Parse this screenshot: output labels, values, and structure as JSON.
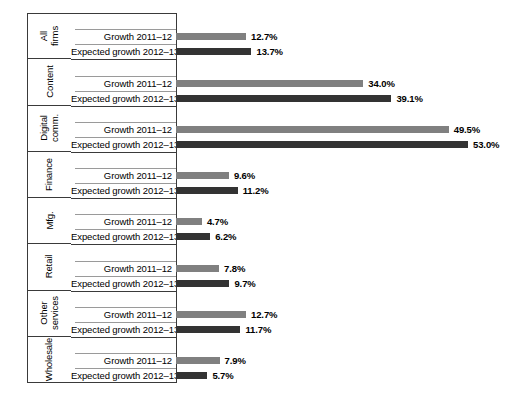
{
  "chart": {
    "type": "bar",
    "orientation": "horizontal",
    "series_labels": {
      "s1": "Growth 2011–12",
      "s2": "Expected growth 2012–13"
    },
    "colors": {
      "series_1": "#808080",
      "series_2": "#333333",
      "frame": "#3a3a3a",
      "row_line": "#9a9a9a",
      "background": "#ffffff"
    }
  },
  "chart_data": {
    "type": "bar",
    "title": "",
    "subtitle": "",
    "xlabel": "",
    "ylabel": "",
    "orientation": "horizontal",
    "grid": false,
    "legend": false,
    "value_format": "percent_1dp",
    "xlim": [
      0,
      53
    ],
    "categories": [
      "All firms",
      "Content",
      "Digital comm.",
      "Finance",
      "Mfg.",
      "Retail",
      "Other services",
      "Wholesale"
    ],
    "series": [
      {
        "name": "Growth 2011–12",
        "color": "#808080",
        "values": [
          12.7,
          34.0,
          49.5,
          9.6,
          4.7,
          7.8,
          12.7,
          7.9
        ]
      },
      {
        "name": "Expected growth 2012–13",
        "color": "#333333",
        "values": [
          13.7,
          39.1,
          53.0,
          11.2,
          6.2,
          9.7,
          11.7,
          5.7
        ]
      }
    ]
  },
  "groups": [
    {
      "category_line1": "All",
      "category_line2": "firms",
      "rows": [
        {
          "label": "Growth 2011–12",
          "value": 12.7,
          "value_text": "12.7%",
          "series": "s1"
        },
        {
          "label": "Expected growth 2012–13",
          "value": 13.7,
          "value_text": "13.7%",
          "series": "s2"
        }
      ]
    },
    {
      "category_line1": "Content",
      "category_line2": "",
      "rows": [
        {
          "label": "Growth 2011–12",
          "value": 34.0,
          "value_text": "34.0%",
          "series": "s1"
        },
        {
          "label": "Expected growth 2012–13",
          "value": 39.1,
          "value_text": "39.1%",
          "series": "s2"
        }
      ]
    },
    {
      "category_line1": "Digital",
      "category_line2": "comm.",
      "rows": [
        {
          "label": "Growth 2011–12",
          "value": 49.5,
          "value_text": "49.5%",
          "series": "s1"
        },
        {
          "label": "Expected growth 2012–13",
          "value": 53.0,
          "value_text": "53.0%",
          "series": "s2"
        }
      ]
    },
    {
      "category_line1": "Finance",
      "category_line2": "",
      "rows": [
        {
          "label": "Growth 2011–12",
          "value": 9.6,
          "value_text": "9.6%",
          "series": "s1"
        },
        {
          "label": "Expected growth 2012–13",
          "value": 11.2,
          "value_text": "11.2%",
          "series": "s2"
        }
      ]
    },
    {
      "category_line1": "Mfg.",
      "category_line2": "",
      "rows": [
        {
          "label": "Growth 2011–12",
          "value": 4.7,
          "value_text": "4.7%",
          "series": "s1"
        },
        {
          "label": "Expected growth 2012–13",
          "value": 6.2,
          "value_text": "6.2%",
          "series": "s2"
        }
      ]
    },
    {
      "category_line1": "Retail",
      "category_line2": "",
      "rows": [
        {
          "label": "Growth 2011–12",
          "value": 7.8,
          "value_text": "7.8%",
          "series": "s1"
        },
        {
          "label": "Expected growth 2012–13",
          "value": 9.7,
          "value_text": "9.7%",
          "series": "s2"
        }
      ]
    },
    {
      "category_line1": "Other",
      "category_line2": "services",
      "rows": [
        {
          "label": "Growth 2011–12",
          "value": 12.7,
          "value_text": "12.7%",
          "series": "s1"
        },
        {
          "label": "Expected growth 2012–13",
          "value": 11.7,
          "value_text": "11.7%",
          "series": "s2"
        }
      ]
    },
    {
      "category_line1": "Wholesale",
      "category_line2": "",
      "rows": [
        {
          "label": "Growth 2011–12",
          "value": 7.9,
          "value_text": "7.9%",
          "series": "s1"
        },
        {
          "label": "Expected growth 2012–13",
          "value": 5.7,
          "value_text": "5.7%",
          "series": "s2"
        }
      ]
    }
  ]
}
